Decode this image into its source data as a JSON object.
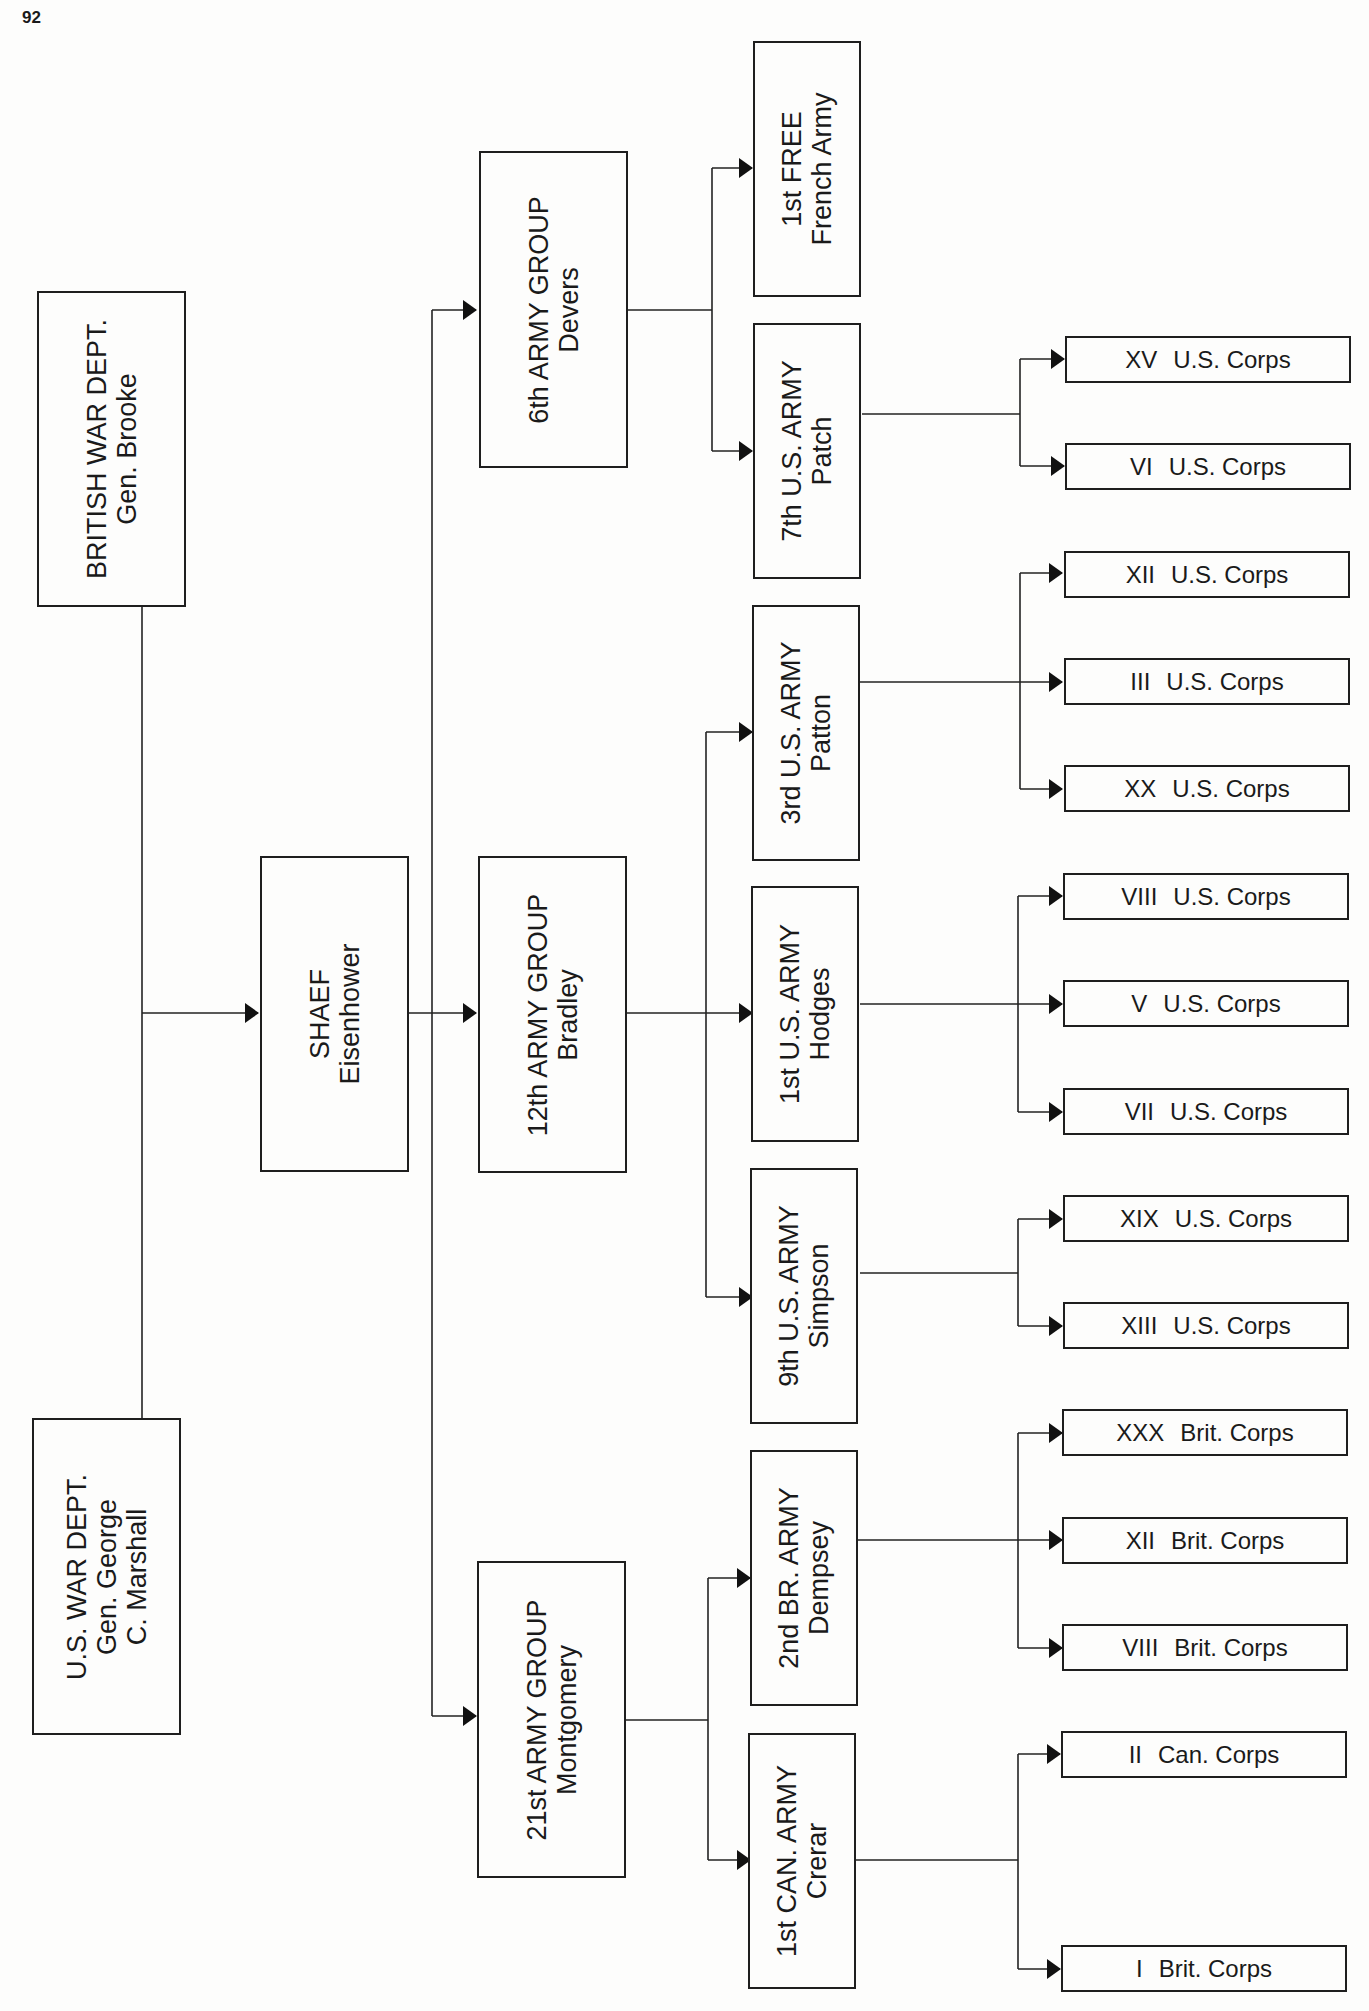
{
  "page_number": "92",
  "nodes": {
    "british": {
      "line1": "BRITISH WAR DEPT.",
      "line2": "Gen. Brooke"
    },
    "us": {
      "line1": "U.S. WAR DEPT.",
      "line2": "Gen. George",
      "line3": "C. Marshall"
    },
    "shaef": {
      "line1": "SHAEF",
      "line2": "Eisenhower"
    },
    "ag6": {
      "line1": "6th ARMY GROUP",
      "line2": "Devers"
    },
    "ag12": {
      "line1": "12th ARMY GROUP",
      "line2": "Bradley"
    },
    "ag21": {
      "line1": "21st ARMY GROUP",
      "line2": "Montgomery"
    },
    "french1": {
      "line1": "1st FREE",
      "line2": "French Army"
    },
    "us7": {
      "line1": "7th U.S. ARMY",
      "line2": "Patch"
    },
    "us3": {
      "line1": "3rd U.S. ARMY",
      "line2": "Patton"
    },
    "us1": {
      "line1": "1st U.S. ARMY",
      "line2": "Hodges"
    },
    "us9": {
      "line1": "9th U.S. ARMY",
      "line2": "Simpson"
    },
    "br2": {
      "line1": "2nd BR. ARMY",
      "line2": "Dempsey"
    },
    "can1": {
      "line1": "1st CAN. ARMY",
      "line2": "Crerar"
    }
  },
  "corps": [
    {
      "num": "XV",
      "name": "U.S. Corps"
    },
    {
      "num": "VI",
      "name": "U.S. Corps"
    },
    {
      "num": "XII",
      "name": "U.S. Corps"
    },
    {
      "num": "III",
      "name": "U.S. Corps"
    },
    {
      "num": "XX",
      "name": "U.S. Corps"
    },
    {
      "num": "VIII",
      "name": "U.S. Corps"
    },
    {
      "num": "V",
      "name": "U.S. Corps"
    },
    {
      "num": "VII",
      "name": "U.S. Corps"
    },
    {
      "num": "XIX",
      "name": "U.S. Corps"
    },
    {
      "num": "XIII",
      "name": "U.S. Corps"
    },
    {
      "num": "XXX",
      "name": "Brit. Corps"
    },
    {
      "num": "XII",
      "name": "Brit. Corps"
    },
    {
      "num": "VIII",
      "name": "Brit. Corps"
    },
    {
      "num": "II",
      "name": "Can. Corps"
    },
    {
      "num": "I",
      "name": "Brit. Corps"
    }
  ]
}
